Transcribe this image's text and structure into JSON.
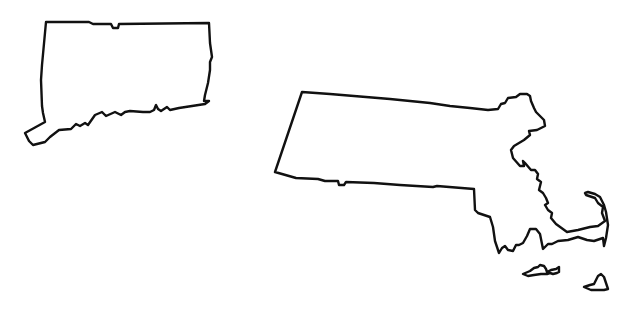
{
  "canvas": {
    "width": 631,
    "height": 314,
    "background": "#ffffff"
  },
  "style": {
    "stroke_color": "#111111",
    "fill_color": "#ffffff",
    "stroke_width": 2.4
  },
  "shapes": [
    {
      "name": "connecticut-outline",
      "points": "46,22 89,22 93,24 111,24 113,28 118,28 119,24 209,23 210,43 212,57 210,62 210,70 208,83 205,95 204,101 209,101 205,104 179,108 170,110 167,107 161,111 158,109 156,105 154,110 150,112 143,112 130,111 125,112 121,115 115,112 106,116 102,112 95,115 88,125 85,123 80,126 76,124 71,129 59,130 50,137 45,142 33,145 29,141 25,133 45,122 43,113 42,106 41,80 42,65 46,22"
    },
    {
      "name": "massachusetts-mainland-outline",
      "points": "302,92 330,94 390,99 430,103 450,106 470,108 488,110 498,109 501,104 505,103 508,98 516,97 520,94 527,94 530,96 531,101 534,108 536,112 544,120 545,126 537,130 529,131 530,135 524,140 514,146 511,150 513,158 520,166 524,166 523,161 525,163 531,170 535,170 538,174 537,179 541,182 539,190 543,193 546,198 548,203 545,205 548,210 552,213 551,218 556,224 567,232 578,230 590,227 598,226 605,221 602,213 603,207 598,203 595,198 586,195 585,193 588,192 595,194 600,197 604,205 606,212 608,225 606,238 604,246 603,238 594,241 587,240 578,237 568,240 558,241 552,244 548,244 543,249 540,234 536,229 530,229 527,236 523,243 519,245 516,245 513,251 508,250 505,246 502,248 499,253 495,241 493,227 490,217 484,215 478,213 475,210 474,189 437,186 433,187 400,185 374,183 346,182 344,185 339,185 338,181 325,181 318,179 296,178 275,172 302,92"
    },
    {
      "name": "marthas-vineyard-outline",
      "points": "523,274 530,271 534,268 538,267 540,265 544,266 546,269 547,272 551,270 556,269 559,267 559,272 557,273 553,274 550,273 547,274 541,274 534,275 528,276 523,274"
    },
    {
      "name": "nantucket-outline",
      "points": "584,287 590,285 594,284 596,280 598,276 601,274 604,277 606,283 608,289 604,290 598,290 591,290 584,287"
    }
  ]
}
